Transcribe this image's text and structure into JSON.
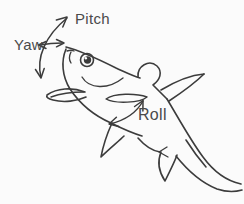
{
  "figure": {
    "name": "fish-sketch"
  },
  "annotations": {
    "pitch": {
      "label": "Pitch",
      "arrow": "double-headed-vertical-arc"
    },
    "yaw": {
      "label": "Yaw",
      "arrow": "double-headed-horizontal-arrow"
    },
    "roll": {
      "label": "Roll",
      "arrow": "double-headed-curved-arrow-around-body"
    }
  },
  "colors": {
    "ink": "#3c3c3c",
    "label_text": "#4a4a4a",
    "background": "#fbfbfb"
  }
}
